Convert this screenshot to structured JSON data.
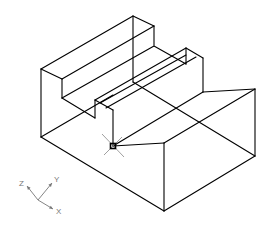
{
  "drawing": {
    "type": "isometric wireframe",
    "stroke_color": "#000000",
    "stroke_width": 1.1,
    "lines": [
      [
        41,
        69,
        133,
        16
      ],
      [
        133,
        16,
        154,
        26
      ],
      [
        154,
        26,
        154,
        45
      ],
      [
        41,
        69,
        62,
        79
      ],
      [
        62,
        79,
        154,
        26
      ],
      [
        62,
        79,
        62,
        98
      ],
      [
        62,
        98,
        154,
        46
      ],
      [
        154,
        46,
        186,
        64
      ],
      [
        186,
        48,
        203,
        58
      ],
      [
        186,
        48,
        186,
        64
      ],
      [
        203,
        58,
        203,
        92
      ],
      [
        133,
        16,
        133,
        82
      ],
      [
        95,
        100,
        186,
        48
      ],
      [
        100,
        103,
        186,
        55
      ],
      [
        106,
        108,
        196,
        57
      ],
      [
        62,
        98,
        95,
        118
      ],
      [
        95,
        100,
        95,
        118
      ],
      [
        95,
        100,
        113,
        110
      ],
      [
        113,
        110,
        113,
        146
      ],
      [
        41,
        69,
        41,
        137
      ],
      [
        41,
        137,
        164,
        211
      ],
      [
        164,
        211,
        255,
        156
      ],
      [
        255,
        89,
        255,
        156
      ],
      [
        203,
        92,
        255,
        89
      ],
      [
        164,
        143,
        255,
        89
      ],
      [
        164,
        143,
        164,
        211
      ],
      [
        113,
        146,
        164,
        143
      ],
      [
        113,
        146,
        203,
        92
      ],
      [
        41,
        137,
        113,
        95
      ],
      [
        133,
        82,
        255,
        156
      ]
    ],
    "marker": {
      "x": 113,
      "y": 146,
      "color": "#000000"
    },
    "crosshair_color": "#888888"
  },
  "axes": {
    "origin": {
      "x": 38,
      "y": 200
    },
    "color": "#777777",
    "labels": [
      {
        "name": "Z",
        "x": 19,
        "y": 186
      },
      {
        "name": "Y",
        "x": 54,
        "y": 182
      },
      {
        "name": "X",
        "x": 56,
        "y": 214
      }
    ]
  }
}
